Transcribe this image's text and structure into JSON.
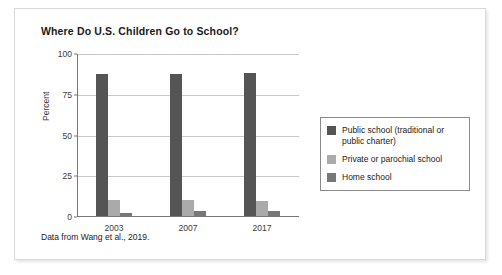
{
  "figure": {
    "title": "Where Do U.S. Children Go to School?",
    "caption": "Data from Wang et al., 2019."
  },
  "chart_data": {
    "type": "bar",
    "title": "Where Do U.S. Children Go to School?",
    "xlabel": "",
    "ylabel": "Percent",
    "categories": [
      "2003",
      "2007",
      "2017"
    ],
    "series": [
      {
        "name": "Public school (traditional or public charter)",
        "color": "#555555",
        "values": [
          87,
          87,
          88
        ]
      },
      {
        "name": "Private or parochial school",
        "color": "#aaaaaa",
        "values": [
          10,
          10,
          9
        ]
      },
      {
        "name": "Home school",
        "color": "#777777",
        "values": [
          2,
          3,
          3
        ]
      }
    ],
    "ylim": [
      0,
      100
    ],
    "yticks": [
      "0",
      "25",
      "50",
      "75",
      "100"
    ],
    "ytick_values": [
      0,
      25,
      50,
      75,
      100
    ],
    "grid": true,
    "legend_position": "right"
  }
}
